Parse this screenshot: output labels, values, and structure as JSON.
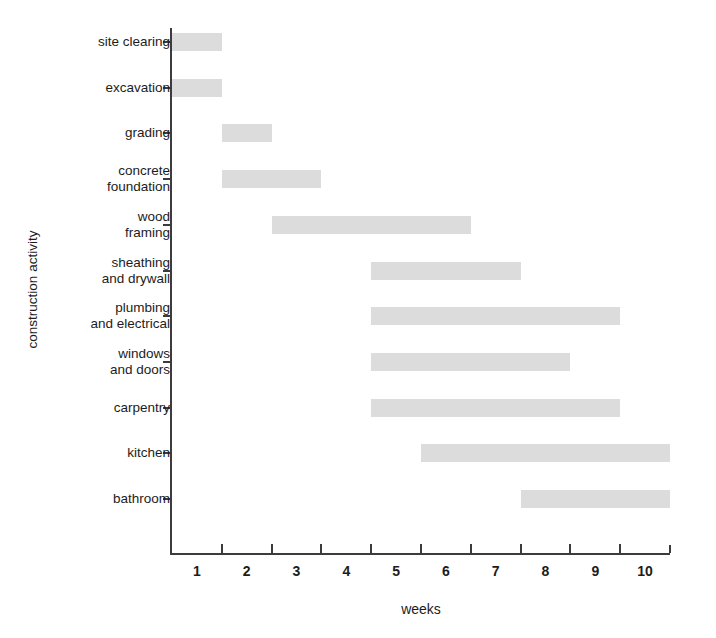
{
  "chart_data": {
    "type": "bar",
    "subtype": "gantt",
    "title": "",
    "xlabel": "weeks",
    "ylabel": "construction activity",
    "xlim": [
      0.5,
      10.5
    ],
    "grid": false,
    "legend": null,
    "orientation": "horizontal",
    "bar_color": "#dcdcdc",
    "axis_color": "#3c3c3c",
    "xticks": [
      1,
      2,
      3,
      4,
      5,
      6,
      7,
      8,
      9,
      10
    ],
    "xtick_labels": [
      "1",
      "2",
      "3",
      "4",
      "5",
      "6",
      "7",
      "8",
      "9",
      "10"
    ],
    "categories": [
      "site clearing",
      "excavation",
      "grading",
      "concrete foundation",
      "wood framing",
      "sheathing and drywall",
      "plumbing and electrical",
      "windows and doors",
      "carpentry",
      "kitchen",
      "bathroom"
    ],
    "category_labels": [
      "site clearing",
      "excavation",
      "grading",
      "concrete\nfoundation",
      "wood\nframing",
      "sheathing\nand drywall",
      "plumbing\nand electrical",
      "windows\nand doors",
      "carpentry",
      "kitchen",
      "bathroom"
    ],
    "tasks": [
      {
        "label": "site clearing",
        "start": 0.5,
        "end": 1.5,
        "duration": 1.0
      },
      {
        "label": "excavation",
        "start": 0.5,
        "end": 1.5,
        "duration": 1.0
      },
      {
        "label": "grading",
        "start": 1.5,
        "end": 2.5,
        "duration": 1.0
      },
      {
        "label": "concrete foundation",
        "start": 1.5,
        "end": 3.5,
        "duration": 2.0
      },
      {
        "label": "wood framing",
        "start": 2.5,
        "end": 6.5,
        "duration": 4.0
      },
      {
        "label": "sheathing and drywall",
        "start": 4.5,
        "end": 7.5,
        "duration": 3.0
      },
      {
        "label": "plumbing and electrical",
        "start": 4.5,
        "end": 9.5,
        "duration": 5.0
      },
      {
        "label": "windows and doors",
        "start": 4.5,
        "end": 8.5,
        "duration": 4.0
      },
      {
        "label": "carpentry",
        "start": 4.5,
        "end": 9.5,
        "duration": 5.0
      },
      {
        "label": "kitchen",
        "start": 5.5,
        "end": 10.5,
        "duration": 5.0
      },
      {
        "label": "bathroom",
        "start": 7.5,
        "end": 10.5,
        "duration": 3.0
      }
    ]
  }
}
